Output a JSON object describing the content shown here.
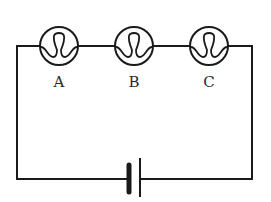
{
  "diagram": {
    "type": "series circuit",
    "bulbs": [
      {
        "label": "A",
        "cx": 59,
        "cy": 46
      },
      {
        "label": "B",
        "cx": 134,
        "cy": 46
      },
      {
        "label": "C",
        "cx": 209,
        "cy": 46
      }
    ],
    "battery": {
      "short_plate_x": 129,
      "long_plate_x": 140
    },
    "colors": {
      "line": "#1a1a1a",
      "background": "#ffffff"
    }
  }
}
